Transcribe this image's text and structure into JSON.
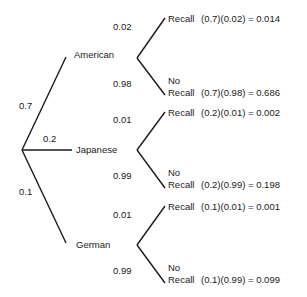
{
  "diagram": {
    "type": "probability-tree",
    "root": {
      "label": ""
    },
    "level1": [
      {
        "name": "American",
        "probability": "0.7"
      },
      {
        "name": "Japanese",
        "probability": "0.2"
      },
      {
        "name": "German",
        "probability": "0.1"
      }
    ],
    "level2": [
      {
        "parent": "American",
        "branches": [
          {
            "probability": "0.02",
            "outcome": "Recall",
            "outcome_line1": "",
            "outcome_line2": "Recall",
            "expression": "(0.7)(0.02) = 0.014",
            "result": "0.014"
          },
          {
            "probability": "0.98",
            "outcome": "No Recall",
            "outcome_line1": "No",
            "outcome_line2": "Recall",
            "expression": "(0.7)(0.98) = 0.686",
            "result": "0.686"
          }
        ]
      },
      {
        "parent": "Japanese",
        "branches": [
          {
            "probability": "0.01",
            "outcome": "Recall",
            "outcome_line1": "",
            "outcome_line2": "Recall",
            "expression": "(0.2)(0.01) = 0.002",
            "result": "0.002"
          },
          {
            "probability": "0.99",
            "outcome": "No Recall",
            "outcome_line1": "No",
            "outcome_line2": "Recall",
            "expression": "(0.2)(0.99) = 0.198",
            "result": "0.198"
          }
        ]
      },
      {
        "parent": "German",
        "branches": [
          {
            "probability": "0.01",
            "outcome": "Recall",
            "outcome_line1": "",
            "outcome_line2": "Recall",
            "expression": "(0.1)(0.01) = 0.001",
            "result": "0.001"
          },
          {
            "probability": "0.99",
            "outcome": "No Recall",
            "outcome_line1": "No",
            "outcome_line2": "Recall",
            "expression": "(0.1)(0.99) = 0.099",
            "result": "0.099"
          }
        ]
      }
    ],
    "colors": {
      "background": "#ffffff",
      "line": "#1a1a1a",
      "text": "#1a1a1a"
    }
  }
}
